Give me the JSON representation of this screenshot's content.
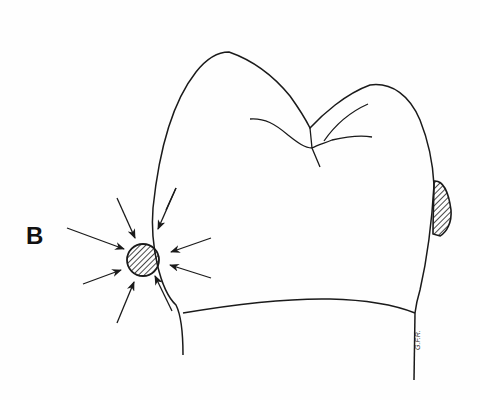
{
  "figure": {
    "label": "B",
    "signature": "G.F.R.",
    "colors": {
      "ink": "#1a1a1a",
      "background": "#fefefe"
    },
    "elements": [
      "tooth-crown-outline",
      "occlusal-fissures",
      "contact-lesion-circle-hatched",
      "distal-lesion-hatched",
      "converging-arrows"
    ],
    "arrow_count": 9
  }
}
